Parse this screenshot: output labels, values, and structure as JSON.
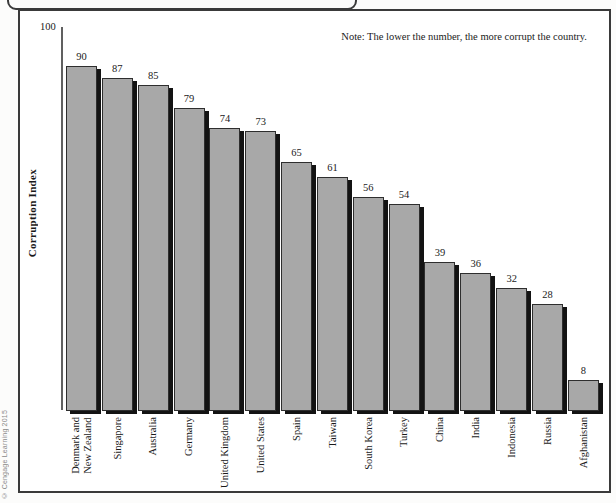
{
  "figure": {
    "note": "Note: The lower the number, the more corrupt the country.",
    "y_axis_title": "Corruption Index",
    "y_axis_top_tick": "100",
    "copyright": "© Cengage Learning 2015"
  },
  "chart_data": {
    "type": "bar",
    "title": "",
    "xlabel": "",
    "ylabel": "Corruption Index",
    "ylim": [
      0,
      100
    ],
    "grid": false,
    "note": "Note: The lower the number, the more corrupt the country.",
    "categories": [
      "Denmark and\nNew Zealand",
      "Singapore",
      "Australia",
      "Germany",
      "United Kingdom",
      "United States",
      "Spain",
      "Taiwan",
      "South Korea",
      "Turkey",
      "China",
      "India",
      "Indonesia",
      "Russia",
      "Afghanistan"
    ],
    "values": [
      90,
      87,
      85,
      79,
      74,
      73,
      65,
      61,
      56,
      54,
      39,
      36,
      32,
      28,
      8
    ],
    "bar_color": "#a8a8a8",
    "bar_outline_color": "#2e2e2e",
    "bar_shadow_color": "#131313",
    "frame_color": "#3a3a3a"
  }
}
